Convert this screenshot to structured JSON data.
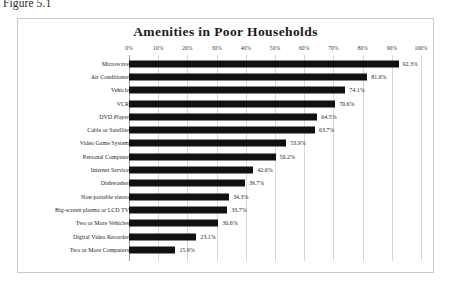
{
  "figure": {
    "caption": "Figure 5.1"
  },
  "chart_data": {
    "type": "bar",
    "orientation": "horizontal",
    "title": "Amenities in Poor Households",
    "xlabel": "",
    "ylabel": "",
    "xlim": [
      0,
      100
    ],
    "xticks": [
      "0%",
      "10%",
      "20%",
      "30%",
      "40%",
      "50%",
      "60%",
      "70%",
      "80%",
      "90%",
      "100%"
    ],
    "xtick_values": [
      0,
      10,
      20,
      30,
      40,
      50,
      60,
      70,
      80,
      90,
      100
    ],
    "grid": true,
    "legend": false,
    "bar_color": "#111111",
    "categories": [
      "Microwave",
      "Air Conditioner",
      "Vehicle",
      "VCR",
      "DVD Player",
      "Cable or Satellite",
      "Video Game System",
      "Personal Computer",
      "Internet Service",
      "Dishwasher",
      "Non-portable stereo",
      "Big-screen plasma or LCD TV",
      "Two or More Vehicles",
      "Digital Video Recorder",
      "Two or More Computers"
    ],
    "values": [
      92.3,
      81.6,
      74.1,
      70.6,
      64.5,
      63.7,
      53.9,
      50.2,
      42.6,
      39.7,
      34.3,
      33.7,
      30.6,
      23.1,
      15.9
    ],
    "value_labels": [
      "92.3%",
      "81.6%",
      "74.1%",
      "70.6%",
      "64.5%",
      "63.7%",
      "53.9%",
      "50.2%",
      "42.6%",
      "39.7%",
      "34.3%",
      "33.7%",
      "30.6%",
      "23.1%",
      "15.9%"
    ]
  }
}
